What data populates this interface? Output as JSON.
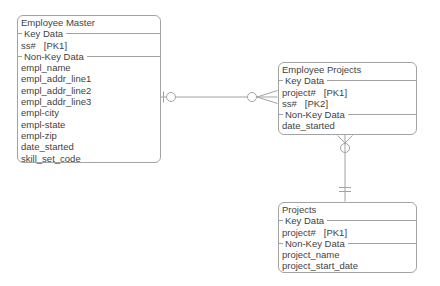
{
  "diagram": {
    "type": "entity-relationship-diagram",
    "background_color": "#ffffff",
    "line_color": "#a3a3a3",
    "text_color": "#3f3f3f"
  },
  "em": {
    "title": "Employee Master",
    "key_header": "Key Data",
    "nonkey_header": "Non-Key Data",
    "keys": [
      {
        "label": "ss#",
        "tag": "[PK1]"
      }
    ],
    "attrs": [
      "empl_name",
      "empl_addr_line1",
      "empl_addr_line2",
      "empl_addr_line3",
      "empl-city",
      "empl-state",
      "empl-zip",
      "date_started",
      "skill_set_code"
    ]
  },
  "ep": {
    "title": "Employee Projects",
    "key_header": "Key Data",
    "nonkey_header": "Non-Key Data",
    "keys": [
      {
        "label": "project#",
        "tag": "[PK1]"
      },
      {
        "label": "ss#",
        "tag": "[PK2]"
      }
    ],
    "attrs": [
      "date_started"
    ]
  },
  "pr": {
    "title": "Projects",
    "key_header": "Key Data",
    "nonkey_header": "Non-Key Data",
    "keys": [
      {
        "label": "project#",
        "tag": "[PK1]"
      }
    ],
    "attrs": [
      "project_name",
      "project_start_date"
    ]
  },
  "relationships": [
    {
      "id": "employee-master-to-employee-projects",
      "orientation": "horizontal",
      "end_a": {
        "entity": "Employee Master",
        "symbols": "bar, circle"
      },
      "end_b": {
        "entity": "Employee Projects",
        "symbols": "circle, crows-foot"
      }
    },
    {
      "id": "projects-to-employee-projects",
      "orientation": "vertical",
      "end_a": {
        "entity": "Employee Projects",
        "symbols": "crows-foot, circle"
      },
      "end_b": {
        "entity": "Projects",
        "symbols": "double-bar"
      }
    }
  ]
}
